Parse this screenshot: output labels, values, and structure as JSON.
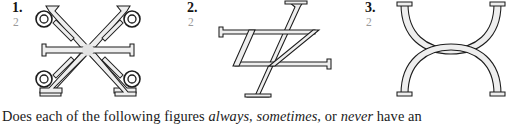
{
  "figures": [
    {
      "number": "1.",
      "sublabel": "2",
      "shape_name": "six-pointed-star-with-four-rings",
      "description": "Symmetric star/asterisk figure formed by two flared diagonal strokes crossing at a center hub, a horizontal serif-capped bar through the center, and four small double rings at the upper-left, upper-right, lower-left and lower-right diagonal arms."
    },
    {
      "number": "2.",
      "sublabel": "2",
      "shape_name": "z-parallelogram-with-serif-strokes",
      "description": "A Z-like parallelogram built from serif-capped horizontal bars and two long flared diagonal strokes that extend past the body at top and bottom."
    },
    {
      "number": "3.",
      "sublabel": "2",
      "shape_name": "opposed-tangent-arcs",
      "description": "An upper arc opening upward (cup shape) with serif caps at its top ends and a lower arch opening downward with serif feet, the two arcs meeting tangentially at the middle."
    }
  ],
  "question": {
    "parts": [
      {
        "text": "Does each of the following figures ",
        "italic": false
      },
      {
        "text": "always, sometimes,",
        "italic": true
      },
      {
        "text": " or ",
        "italic": false
      },
      {
        "text": "never",
        "italic": true
      },
      {
        "text": " have an",
        "italic": false
      }
    ],
    "full_text": "Does each of the following figures always, sometimes, or never have an"
  },
  "colors": {
    "ink": "#1c1c1c",
    "fill": "#eeeeee",
    "sublabel": "#9a9a9a",
    "background": "#ffffff"
  }
}
